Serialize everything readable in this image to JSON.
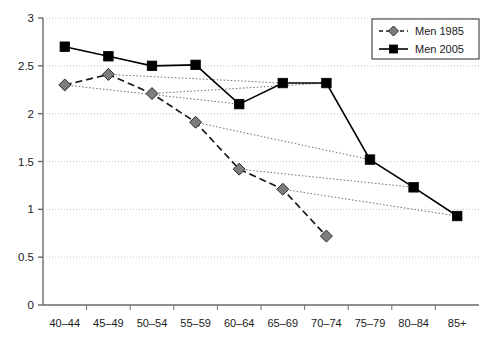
{
  "chart_data": {
    "type": "line",
    "title": "",
    "subtitle": "",
    "xlabel": "",
    "ylabel": "",
    "categories": [
      "40–44",
      "45–49",
      "50–54",
      "55–59",
      "60–64",
      "65–69",
      "70–74",
      "75–79",
      "80–84",
      "85+"
    ],
    "ylim": [
      0,
      3
    ],
    "y_ticks": [
      "0",
      "0.5",
      "1",
      "1.5",
      "2",
      "2.5",
      "3"
    ],
    "y_tick_values": [
      0,
      0.5,
      1,
      1.5,
      2,
      2.5,
      3
    ],
    "grid": "horizontal-dotted",
    "legend_position": "top-right",
    "series": [
      {
        "name": "Men 1985",
        "style": "dashed",
        "marker": "diamond",
        "marker_color": "#7d7d7d",
        "line_color": "#1a1a1a",
        "values": [
          2.3,
          2.41,
          2.21,
          1.91,
          1.42,
          1.21,
          0.72,
          null,
          null,
          null
        ]
      },
      {
        "name": "Men 2005",
        "style": "solid",
        "marker": "square",
        "marker_color": "#000000",
        "line_color": "#000000",
        "values": [
          2.7,
          2.6,
          2.5,
          2.51,
          2.1,
          2.32,
          2.32,
          1.52,
          1.23,
          0.93
        ]
      }
    ],
    "connectors": {
      "name": "cohort-connector",
      "style": "dotted",
      "color": "#707070",
      "description": "dotted lines linking each Men 1985 point to the Men 2005 point four age groups later",
      "pairs": [
        {
          "from_index": 0,
          "to_index": 4,
          "from_value": 2.3,
          "to_value": 2.1
        },
        {
          "from_index": 1,
          "to_index": 5,
          "from_value": 2.41,
          "to_value": 2.32
        },
        {
          "from_index": 2,
          "to_index": 6,
          "from_value": 2.21,
          "to_value": 2.32
        },
        {
          "from_index": 3,
          "to_index": 7,
          "from_value": 1.91,
          "to_value": 1.52
        },
        {
          "from_index": 4,
          "to_index": 8,
          "from_value": 1.42,
          "to_value": 1.23
        },
        {
          "from_index": 5,
          "to_index": 9,
          "from_value": 1.21,
          "to_value": 0.93
        }
      ]
    }
  },
  "legend": {
    "items": [
      {
        "label": "Men 1985"
      },
      {
        "label": "Men 2005"
      }
    ]
  },
  "colors": {
    "axis": "#6a6a6a",
    "grid": "#c8c8c8",
    "series_1985_marker": "#7d7d7d",
    "series_2005_marker": "#000000",
    "text": "#1a1a1a"
  }
}
